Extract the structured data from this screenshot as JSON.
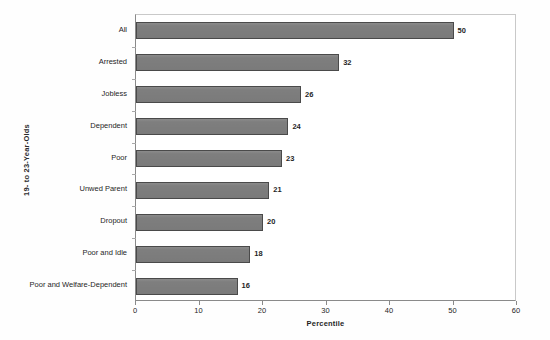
{
  "chart_data": {
    "type": "bar",
    "orientation": "horizontal",
    "title": "",
    "xlabel": "Percentile",
    "ylabel": "19- to 23-Year-Olds",
    "xlim": [
      0,
      60
    ],
    "xticks": [
      0,
      10,
      20,
      30,
      40,
      50,
      60
    ],
    "xtick_labels": [
      "0",
      "10",
      "20",
      "30",
      "40",
      "50",
      "60"
    ],
    "grid": false,
    "legend": null,
    "bar_color": "#7e7e7e",
    "bar_edge_color": "#4a4a4a",
    "show_value_labels": true,
    "categories": [
      "All",
      "Arrested",
      "Jobless",
      "Dependent",
      "Poor",
      "Unwed Parent",
      "Dropout",
      "Poor and Idle",
      "Poor and Welfare-Dependent"
    ],
    "values": [
      50,
      32,
      26,
      24,
      23,
      21,
      20,
      18,
      16
    ],
    "value_labels": [
      "50",
      "32",
      "26",
      "24",
      "23",
      "21",
      "20",
      "18",
      "16"
    ]
  }
}
